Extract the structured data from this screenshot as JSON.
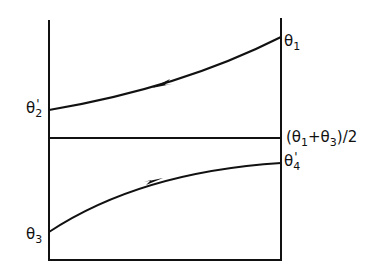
{
  "diagram": {
    "stroke_color": "#111111",
    "background": "#ffffff",
    "labels": {
      "theta1": {
        "base": "θ",
        "sub": "1"
      },
      "theta2p": {
        "base": "θ",
        "prime": "'",
        "sub": "2"
      },
      "theta3": {
        "base": "θ",
        "sub": "3"
      },
      "theta4p": {
        "base": "θ",
        "prime": "'",
        "sub": "4"
      },
      "mean": {
        "open": "(θ",
        "sub1": "1",
        "plus": "+θ",
        "sub3": "3",
        "close": ")/2"
      }
    },
    "curves": [
      {
        "name": "upper-curve",
        "from": "θ1",
        "to": "θ2'",
        "direction": "right-to-left"
      },
      {
        "name": "lower-curve",
        "from": "θ3",
        "to": "θ4'",
        "direction": "left-to-right"
      }
    ],
    "reference_line": "(θ1+θ3)/2"
  }
}
